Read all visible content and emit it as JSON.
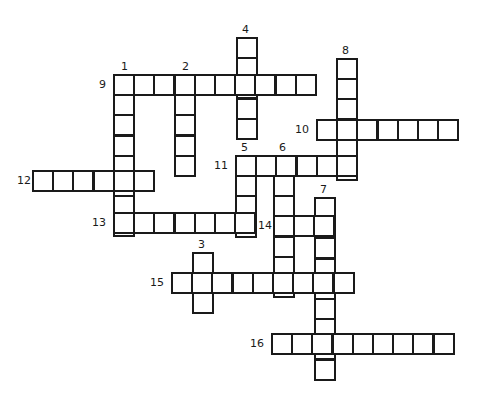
{
  "puzzle": {
    "type": "crossword",
    "colors": {
      "ink": "#1a1a1a",
      "paper": "#ffffff"
    },
    "entries": [
      {
        "number": "1",
        "direction": "down",
        "length": 8
      },
      {
        "number": "2",
        "direction": "down",
        "length": 5
      },
      {
        "number": "3",
        "direction": "down",
        "length": 3
      },
      {
        "number": "4",
        "direction": "down",
        "length": 5
      },
      {
        "number": "5",
        "direction": "down",
        "length": 4
      },
      {
        "number": "6",
        "direction": "down",
        "length": 7
      },
      {
        "number": "7",
        "direction": "down",
        "length": 9
      },
      {
        "number": "8",
        "direction": "down",
        "length": 6
      },
      {
        "number": "9",
        "direction": "across",
        "length": 10
      },
      {
        "number": "10",
        "direction": "across",
        "length": 7
      },
      {
        "number": "11",
        "direction": "across",
        "length": 6
      },
      {
        "number": "12",
        "direction": "across",
        "length": 6
      },
      {
        "number": "13",
        "direction": "across",
        "length": 7
      },
      {
        "number": "14",
        "direction": "across",
        "length": 3
      },
      {
        "number": "15",
        "direction": "across",
        "length": 9
      },
      {
        "number": "16",
        "direction": "across",
        "length": 9
      }
    ]
  }
}
